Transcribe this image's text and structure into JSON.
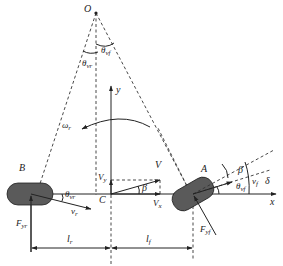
{
  "diagram": {
    "type": "vehicle-bicycle-model",
    "colors": {
      "wheel_fill": "#5a5a5a",
      "line": "#222222",
      "background": "#ffffff"
    },
    "labels": {
      "O": "O",
      "theta_vf": {
        "base": "θ",
        "sub": "vf"
      },
      "theta_vr": {
        "base": "θ",
        "sub": "vr"
      },
      "y_axis": "y",
      "x_axis": "x",
      "omega_r": {
        "base": "ω",
        "sub": "r"
      },
      "V": "V",
      "V_y": {
        "base": "V",
        "sub": "y"
      },
      "V_x": {
        "base": "V",
        "sub": "x"
      },
      "beta_C": "β",
      "C": "C",
      "B": "B",
      "A": "A",
      "theta_vr_B": {
        "base": "θ",
        "sub": "vr"
      },
      "v_r": {
        "base": "v",
        "sub": "r"
      },
      "F_yr": {
        "base": "F",
        "sub": "yr"
      },
      "beta_A": "β",
      "theta_vf_A": {
        "base": "θ",
        "sub": "vf"
      },
      "v_f": {
        "base": "v",
        "sub": "f"
      },
      "delta": "δ",
      "F_yf": {
        "base": "F",
        "sub": "yf"
      },
      "l_r": {
        "base": "l",
        "sub": "r"
      },
      "l_f": {
        "base": "l",
        "sub": "f"
      }
    }
  }
}
